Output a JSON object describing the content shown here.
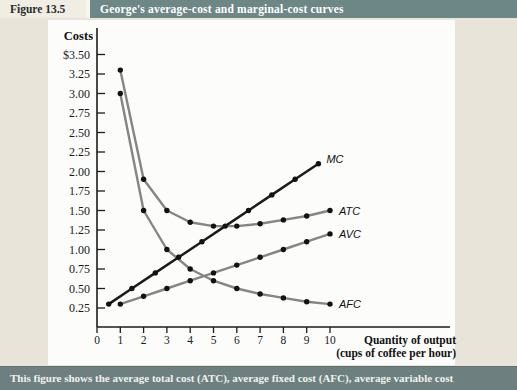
{
  "header": {
    "figure_label": "Figure 13.5",
    "title": "George's average-cost and marginal-cost curves"
  },
  "caption": {
    "text": "This figure shows the average total cost (ATC), average fixed cost (AFC), average variable cost"
  },
  "colors": {
    "header_bar": "#6d8786",
    "footer_bar": "#6d807f",
    "page_bg": "#e8e4d9",
    "figure_label_bg": "#f0ede3",
    "panel_bg": "#fcfcfa",
    "curve_gray": "#858585",
    "mc_black": "#1b1b1b",
    "dot": "#121212",
    "axis": "#1c1c1c",
    "header_text": "#ffffff",
    "figure_label_text": "#2b2b2b"
  },
  "chart_data": {
    "type": "line",
    "title": "George's average-cost and marginal-cost curves",
    "ylabel": "Costs",
    "xlabel": "Quantity of output (cups of coffee per hour)",
    "x_axis": {
      "title_line1": "Quantity of output",
      "title_line2": "(cups of coffee per hour)",
      "tick_labels": [
        "0",
        "1",
        "2",
        "3",
        "4",
        "5",
        "6",
        "7",
        "8",
        "9",
        "10"
      ],
      "range": [
        0,
        10.9
      ]
    },
    "y_axis": {
      "title": "Costs",
      "range": [
        0,
        3.6
      ],
      "ticks": [
        {
          "value": 3.5,
          "label": "$3.50"
        },
        {
          "value": 3.25,
          "label": "3.25"
        },
        {
          "value": 3.0,
          "label": "3.00"
        },
        {
          "value": 2.75,
          "label": "2.75"
        },
        {
          "value": 2.5,
          "label": "2.50"
        },
        {
          "value": 2.25,
          "label": "2.25"
        },
        {
          "value": 2.0,
          "label": "2.00"
        },
        {
          "value": 1.75,
          "label": "1.75"
        },
        {
          "value": 1.5,
          "label": "1.50"
        },
        {
          "value": 1.25,
          "label": "1.25"
        },
        {
          "value": 1.0,
          "label": "1.00"
        },
        {
          "value": 0.75,
          "label": "0.75"
        },
        {
          "value": 0.5,
          "label": "0.50"
        },
        {
          "value": 0.25,
          "label": "0.25"
        }
      ]
    },
    "series": [
      {
        "name": "MC",
        "label": "MC",
        "color": "#1b1b1b",
        "x": [
          0.5,
          1.5,
          2.5,
          3.5,
          4.5,
          5.5,
          6.5,
          7.5,
          8.5,
          9.5
        ],
        "y": [
          0.3,
          0.5,
          0.7,
          0.9,
          1.1,
          1.3,
          1.5,
          1.7,
          1.9,
          2.1
        ]
      },
      {
        "name": "ATC",
        "label": "ATC",
        "color": "#858585",
        "x": [
          1,
          2,
          3,
          4,
          5,
          6,
          7,
          8,
          9,
          10
        ],
        "y": [
          3.3,
          1.9,
          1.5,
          1.35,
          1.3,
          1.3,
          1.33,
          1.38,
          1.43,
          1.5
        ]
      },
      {
        "name": "AVC",
        "label": "AVC",
        "color": "#858585",
        "x": [
          1,
          2,
          3,
          4,
          5,
          6,
          7,
          8,
          9,
          10
        ],
        "y": [
          0.3,
          0.4,
          0.5,
          0.6,
          0.7,
          0.8,
          0.9,
          1.0,
          1.1,
          1.2
        ]
      },
      {
        "name": "AFC",
        "label": "AFC",
        "color": "#858585",
        "x": [
          1,
          2,
          3,
          4,
          5,
          6,
          7,
          8,
          9,
          10
        ],
        "y": [
          3.0,
          1.5,
          1.0,
          0.75,
          0.6,
          0.5,
          0.43,
          0.38,
          0.33,
          0.3
        ]
      }
    ]
  }
}
